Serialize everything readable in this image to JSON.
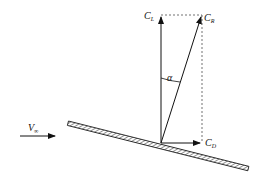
{
  "diagram": {
    "type": "aerodynamic-force-vector-diagram",
    "labels": {
      "lift": {
        "main": "C",
        "sub": "L"
      },
      "resultant": {
        "main": "C",
        "sub": "R"
      },
      "drag": {
        "main": "C",
        "sub": "D"
      },
      "angle": "α",
      "freestream": {
        "main": "V",
        "sub": "∞"
      }
    },
    "colors": {
      "stroke": "#111111",
      "dashed": "#333333",
      "plate_fill": "#ffffff"
    }
  }
}
